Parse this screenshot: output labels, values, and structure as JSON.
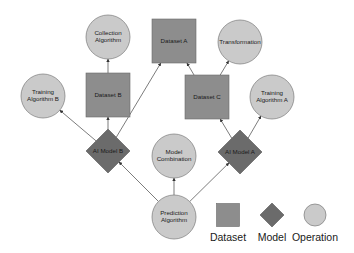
{
  "colors": {
    "dataset_fill": "#8d8d8d",
    "dataset_stroke": "#6a6a6a",
    "model_fill": "#6b6b6b",
    "model_stroke": "#555555",
    "operation_fill": "#cacaca",
    "operation_stroke": "#7a7a7a",
    "edge": "#444444",
    "background": "#ffffff"
  },
  "nodes": [
    {
      "id": "collection_algorithm",
      "type": "operation",
      "lines": [
        "Collection",
        "Algorithm"
      ],
      "cx": 108,
      "cy": 37,
      "r": 22
    },
    {
      "id": "dataset_a",
      "type": "dataset",
      "lines": [
        "Dataset A"
      ],
      "cx": 174,
      "cy": 41,
      "size": 44
    },
    {
      "id": "transformation",
      "type": "operation",
      "lines": [
        "Transformation"
      ],
      "cx": 240,
      "cy": 42,
      "r": 22
    },
    {
      "id": "training_algorithm_b",
      "type": "operation",
      "lines": [
        "Training",
        "Algorithm B"
      ],
      "cx": 43,
      "cy": 96,
      "r": 22
    },
    {
      "id": "dataset_b",
      "type": "dataset",
      "lines": [
        "Dataset B"
      ],
      "cx": 108,
      "cy": 95,
      "size": 44
    },
    {
      "id": "dataset_c",
      "type": "dataset",
      "lines": [
        "Dataset C"
      ],
      "cx": 207,
      "cy": 97,
      "size": 44
    },
    {
      "id": "training_algorithm_a",
      "type": "operation",
      "lines": [
        "Training",
        "Algorithm A"
      ],
      "cx": 272,
      "cy": 97,
      "r": 22
    },
    {
      "id": "ai_model_b",
      "type": "model",
      "lines": [
        "AI Model B"
      ],
      "cx": 108,
      "cy": 151,
      "half": 22
    },
    {
      "id": "model_combination",
      "type": "operation",
      "lines": [
        "Model",
        "Combination"
      ],
      "cx": 174,
      "cy": 156,
      "r": 22
    },
    {
      "id": "ai_model_a",
      "type": "model",
      "lines": [
        "AI Model A"
      ],
      "cx": 240,
      "cy": 152,
      "half": 22
    },
    {
      "id": "prediction_algorithm",
      "type": "operation",
      "lines": [
        "Prediction",
        "Algorithm"
      ],
      "cx": 174,
      "cy": 217,
      "r": 22
    }
  ],
  "edges": [
    {
      "from": "dataset_b",
      "to": "collection_algorithm"
    },
    {
      "from": "ai_model_b",
      "to": "training_algorithm_b"
    },
    {
      "from": "ai_model_b",
      "to": "dataset_b"
    },
    {
      "from": "ai_model_b",
      "to": "dataset_a"
    },
    {
      "from": "dataset_c",
      "to": "dataset_a"
    },
    {
      "from": "dataset_c",
      "to": "transformation"
    },
    {
      "from": "ai_model_a",
      "to": "dataset_c"
    },
    {
      "from": "ai_model_a",
      "to": "training_algorithm_a"
    },
    {
      "from": "prediction_algorithm",
      "to": "ai_model_b"
    },
    {
      "from": "prediction_algorithm",
      "to": "model_combination"
    },
    {
      "from": "prediction_algorithm",
      "to": "ai_model_a"
    }
  ],
  "legend": {
    "items": [
      {
        "type": "dataset",
        "label": "Dataset",
        "cx": 228,
        "cy": 215
      },
      {
        "type": "model",
        "label": "Model",
        "cx": 272,
        "cy": 215
      },
      {
        "type": "operation",
        "label": "Operation",
        "cx": 315,
        "cy": 215
      }
    ]
  }
}
